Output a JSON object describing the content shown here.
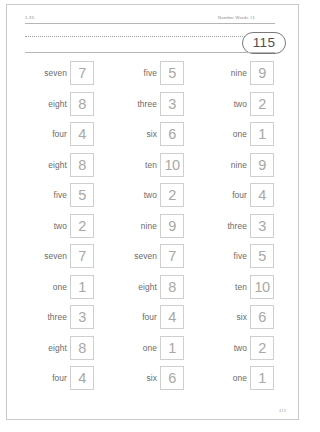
{
  "page": {
    "lesson_code": "1-35",
    "title": "Number Words #1",
    "page_number": "115",
    "footer_code": "419"
  },
  "columns": [
    {
      "name": "column-1",
      "rows": [
        {
          "word": "seven",
          "digit": "7"
        },
        {
          "word": "eight",
          "digit": "8"
        },
        {
          "word": "four",
          "digit": "4"
        },
        {
          "word": "eight",
          "digit": "8"
        },
        {
          "word": "five",
          "digit": "5"
        },
        {
          "word": "two",
          "digit": "2"
        },
        {
          "word": "seven",
          "digit": "7"
        },
        {
          "word": "one",
          "digit": "1"
        },
        {
          "word": "three",
          "digit": "3"
        },
        {
          "word": "eight",
          "digit": "8"
        },
        {
          "word": "four",
          "digit": "4"
        }
      ]
    },
    {
      "name": "column-2",
      "rows": [
        {
          "word": "five",
          "digit": "5"
        },
        {
          "word": "three",
          "digit": "3"
        },
        {
          "word": "six",
          "digit": "6"
        },
        {
          "word": "ten",
          "digit": "10"
        },
        {
          "word": "two",
          "digit": "2"
        },
        {
          "word": "nine",
          "digit": "9"
        },
        {
          "word": "seven",
          "digit": "7"
        },
        {
          "word": "eight",
          "digit": "8"
        },
        {
          "word": "four",
          "digit": "4"
        },
        {
          "word": "one",
          "digit": "1"
        },
        {
          "word": "six",
          "digit": "6"
        }
      ]
    },
    {
      "name": "column-3",
      "rows": [
        {
          "word": "nine",
          "digit": "9"
        },
        {
          "word": "two",
          "digit": "2"
        },
        {
          "word": "one",
          "digit": "1"
        },
        {
          "word": "nine",
          "digit": "9"
        },
        {
          "word": "four",
          "digit": "4"
        },
        {
          "word": "three",
          "digit": "3"
        },
        {
          "word": "five",
          "digit": "5"
        },
        {
          "word": "ten",
          "digit": "10"
        },
        {
          "word": "six",
          "digit": "6"
        },
        {
          "word": "two",
          "digit": "2"
        },
        {
          "word": "one",
          "digit": "1"
        }
      ]
    }
  ]
}
